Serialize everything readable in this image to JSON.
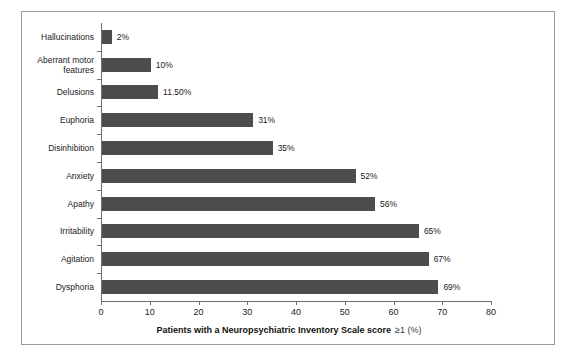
{
  "chart_data": {
    "type": "bar",
    "orientation": "horizontal",
    "title": "",
    "subtitle": "",
    "xlabel": "Patients with a Neuropsychiatric Inventory Scale score",
    "xlabel_suffix": "≥1 (%)",
    "ylabel": "",
    "xlim": [
      0,
      80
    ],
    "xticks": [
      0,
      10,
      20,
      30,
      40,
      50,
      60,
      70,
      80
    ],
    "xtick_labels": [
      "0",
      "10",
      "20",
      "30",
      "40",
      "50",
      "60",
      "70",
      "80"
    ],
    "grid": false,
    "legend": false,
    "categories": [
      "Hallucinations",
      "Aberrant motor\nfeatures",
      "Delusions",
      "Euphoria",
      "Disinhibition",
      "Anxiety",
      "Apathy",
      "Irritability",
      "Agitation",
      "Dysphoria"
    ],
    "values": [
      2,
      10,
      11.5,
      31,
      35,
      52,
      56,
      65,
      67,
      69
    ],
    "value_labels": [
      "2%",
      "10%",
      "11.50%",
      "31%",
      "35%",
      "52%",
      "56%",
      "65%",
      "67%",
      "69%"
    ],
    "bar_color": "#4d4d4d",
    "axis_color": "#6e6e6e",
    "frame_color": "#9a9a9a",
    "background_color": "#ffffff"
  }
}
